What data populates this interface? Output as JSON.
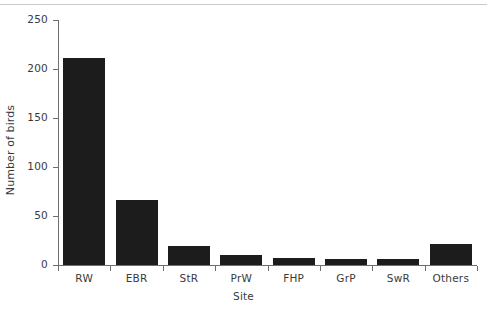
{
  "chart_data": {
    "type": "bar",
    "title": "",
    "subtitle": "",
    "xlabel": "Site",
    "ylabel": "Number of birds",
    "categories": [
      "RW",
      "EBR",
      "StR",
      "PrW",
      "FHP",
      "GrP",
      "SwR",
      "Others"
    ],
    "values": [
      211,
      66,
      19,
      10,
      7,
      6,
      6,
      21
    ],
    "ylim": [
      0,
      250
    ],
    "yticks": [
      0,
      50,
      100,
      150,
      200,
      250
    ],
    "ytick_labels": [
      "0",
      "50",
      "100",
      "150",
      "200",
      "250"
    ],
    "grid": false,
    "legend": null,
    "bar_color": "#1c1c1c",
    "axis_color": "#6e6e6e",
    "background_color": "#ffffff"
  }
}
